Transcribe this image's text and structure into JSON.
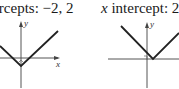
{
  "panels": [
    {
      "caption_prefix": "x",
      "caption": "intercepts: −2, 2",
      "caption_display": "tercepts: −2, 2",
      "x_axis_label": "x",
      "y_axis_label": "y",
      "graph": "V-shaped absolute value graph with vertex below origin",
      "x_intercepts": [
        -2,
        2
      ]
    },
    {
      "caption_prefix": "x",
      "caption": "intercept: 2",
      "x_axis_label": "x",
      "y_axis_label": "y",
      "graph": "V-shaped absolute value graph with vertex on x-axis",
      "x_intercepts": [
        2
      ]
    }
  ],
  "colors": {
    "line": "#222222",
    "axis": "#555555",
    "text": "#1a1a1a"
  }
}
